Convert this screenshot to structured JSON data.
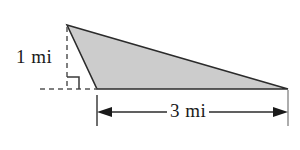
{
  "figure": {
    "kind": "geometry-diagram",
    "shape": "right-triangle-with-obtuse-extension",
    "background_color": "#ffffff",
    "fill_color": "#cccccc",
    "stroke_color": "#2b2b2b",
    "dash_color": "#555555",
    "labels": {
      "height": "1 mi",
      "base": "3 mi"
    },
    "measurements": [
      {
        "name": "height",
        "value": 1,
        "unit": "mi",
        "text": "1 mi",
        "orientation": "vertical"
      },
      {
        "name": "base",
        "value": 3,
        "unit": "mi",
        "text": "3 mi",
        "orientation": "horizontal"
      }
    ],
    "markers": {
      "right_angle": "right-angle-square",
      "right_angle_present": true
    },
    "geometry": {
      "apex": [
        67,
        25
      ],
      "base_left": [
        97,
        89
      ],
      "base_right": [
        288,
        89
      ],
      "foot_of_altitude": [
        67,
        89
      ],
      "altitude_dash_from": [
        67,
        27
      ],
      "altitude_dash_to": [
        67,
        89
      ],
      "baseline_dash_from": [
        40,
        89
      ],
      "baseline_dash_to": [
        97,
        89
      ],
      "right_angle_box": {
        "x": 67,
        "y": 77,
        "w": 12,
        "h": 12
      },
      "dimension_line_y": 112,
      "dimension_tick_left_x": 97,
      "dimension_tick_right_x": 288,
      "dimension_tick_top": 95,
      "dimension_tick_bottom": 126
    }
  }
}
